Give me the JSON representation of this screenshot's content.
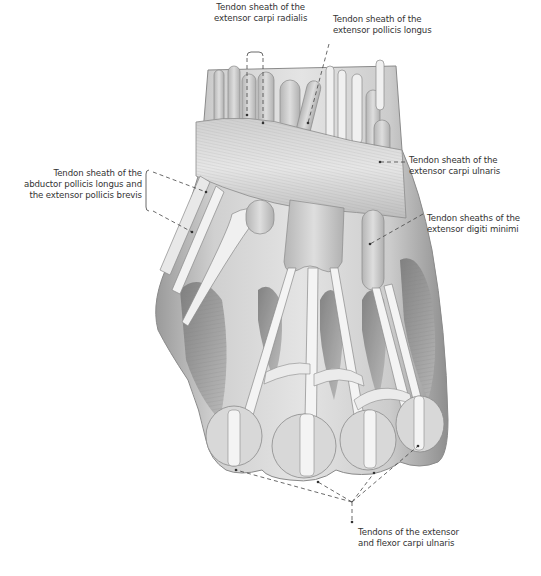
{
  "figure": {
    "colors": {
      "background": "#ffffff",
      "text": "#333333",
      "leader": "#444444",
      "skin_light": "#e2e2e2",
      "skin_mid": "#c4c4c4",
      "skin_dark": "#8a8a8a",
      "tendon": "#f2f2f2",
      "sheath": "#cfcfcf"
    }
  },
  "labels": [
    {
      "id": "ecr",
      "lines": [
        "Tendon sheath of the",
        "extensor carpi radialis"
      ],
      "x": 214,
      "y": 2,
      "align": "center"
    },
    {
      "id": "epl",
      "lines": [
        "Tendon sheath of the",
        "extensor pollicis longus"
      ],
      "x": 333,
      "y": 14,
      "align": "left"
    },
    {
      "id": "apl",
      "lines": [
        "Tendon sheath of the",
        "abductor pollicis longus and",
        "the extensor pollicis brevis"
      ],
      "x": 2,
      "y": 168,
      "align": "right",
      "width": 140
    },
    {
      "id": "ecu",
      "lines": [
        "Tendon sheath of the",
        "extensor carpi ulnaris"
      ],
      "x": 409,
      "y": 155,
      "align": "left"
    },
    {
      "id": "edm",
      "lines": [
        "Tendon sheaths of the",
        "extensor digiti minimi"
      ],
      "x": 427,
      "y": 213,
      "align": "left"
    },
    {
      "id": "ext_flex",
      "lines": [
        "Tendons of the extensor",
        "and flexor carpi ulnaris"
      ],
      "x": 358,
      "y": 527,
      "align": "left"
    }
  ],
  "leaders": [
    {
      "for": "ecr",
      "points": [
        [
          247,
          52
        ],
        [
          247,
          58
        ]
      ],
      "style": "bracket-top"
    },
    {
      "for": "ecr",
      "points": [
        [
          247,
          58
        ],
        [
          247,
          115
        ]
      ]
    },
    {
      "for": "ecr",
      "points": [
        [
          263,
          58
        ],
        [
          263,
          123
        ]
      ]
    },
    {
      "for": "epl",
      "points": [
        [
          329,
          44
        ],
        [
          308,
          123
        ]
      ]
    },
    {
      "for": "apl",
      "points": [
        [
          153,
          172
        ],
        [
          206,
          192
        ]
      ]
    },
    {
      "for": "apl",
      "points": [
        [
          153,
          211
        ],
        [
          192,
          232
        ]
      ]
    },
    {
      "for": "ecu",
      "points": [
        [
          405,
          162
        ],
        [
          380,
          162
        ]
      ]
    },
    {
      "for": "edm",
      "points": [
        [
          423,
          214
        ],
        [
          370,
          244
        ]
      ]
    },
    {
      "for": "ext_flex",
      "points": [
        [
          352,
          502
        ],
        [
          236,
          470
        ]
      ]
    },
    {
      "for": "ext_flex",
      "points": [
        [
          352,
          502
        ],
        [
          318,
          482
        ]
      ]
    },
    {
      "for": "ext_flex",
      "points": [
        [
          352,
          502
        ],
        [
          374,
          473
        ]
      ]
    },
    {
      "for": "ext_flex",
      "points": [
        [
          352,
          502
        ],
        [
          418,
          446
        ]
      ]
    },
    {
      "for": "ext_flex",
      "points": [
        [
          352,
          502
        ],
        [
          352,
          522
        ]
      ]
    }
  ],
  "brackets": [
    {
      "for": "apl",
      "x": 146,
      "y1": 170,
      "y2": 211
    },
    {
      "for": "ecr",
      "x1": 247,
      "x2": 263,
      "y": 52
    }
  ]
}
